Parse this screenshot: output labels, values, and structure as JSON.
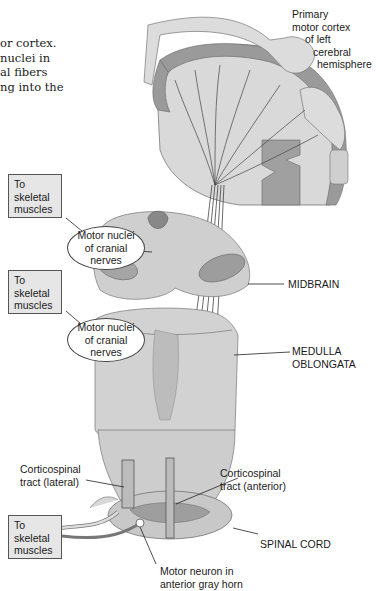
{
  "caption_fragment": {
    "lines": [
      "or cortex.",
      " nuclei in",
      "al fibers",
      "ng into the"
    ]
  },
  "labels": {
    "cortex": [
      "Primary",
      "motor cortex",
      "of left",
      "cerebral",
      "hemisphere"
    ],
    "midbrain": "MIDBRAIN",
    "medulla": [
      "MEDULLA",
      "OBLONGATA"
    ],
    "spinal_cord": "SPINAL CORD",
    "tract_lateral": [
      "Corticospinal",
      "tract (lateral)"
    ],
    "tract_anterior": [
      "Corticospinal",
      "tract (anterior)"
    ],
    "motor_neuron": [
      "Motor neuron in",
      "anterior gray horn"
    ],
    "motor_nuclei_1": [
      "Motor nuclei",
      "of cranial",
      "nerves"
    ],
    "motor_nuclei_2": [
      "Motor nuclei",
      "of cranial",
      "nerves"
    ],
    "skeletal_1": [
      "To",
      "skeletal",
      "muscles"
    ],
    "skeletal_2": [
      "To",
      "skeletal",
      "muscles"
    ],
    "skeletal_3": [
      "To",
      "skeletal",
      "muscles"
    ]
  },
  "colors": {
    "cortex_gray": "#9a9a9a",
    "white_matter": "#d9d9d9",
    "tissue_light": "#cfcfcf",
    "tissue_mid": "#b5b5b5",
    "fiber": "#444444",
    "box_fill": "#e6e6e6"
  }
}
